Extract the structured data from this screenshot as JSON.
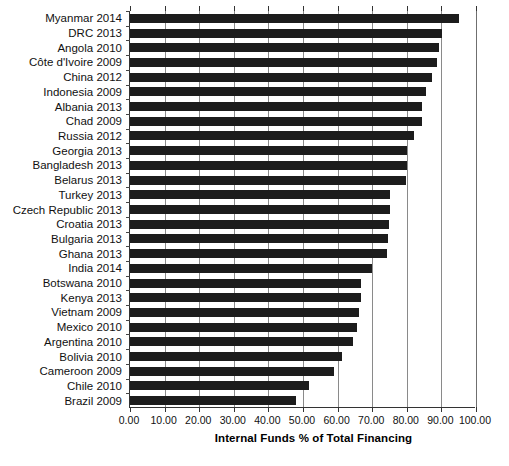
{
  "chart_data": {
    "type": "bar",
    "orientation": "horizontal",
    "title": "",
    "xlabel": "Internal Funds % of Total Financing",
    "ylabel": "",
    "xlim": [
      0,
      100
    ],
    "xticks": [
      "0.00",
      "10.00",
      "20.00",
      "30.00",
      "40.00",
      "50.00",
      "60.00",
      "70.00",
      "80.00",
      "90.00",
      "100.00"
    ],
    "xtick_values": [
      0,
      10,
      20,
      30,
      40,
      50,
      60,
      70,
      80,
      90,
      100
    ],
    "grid": true,
    "grid_axis": "x",
    "legend": "none",
    "bar_color": "#1c1c1c",
    "categories": [
      "Myanmar 2014",
      "DRC 2013",
      "Angola 2010",
      "Côte d'Ivoire 2009",
      "China 2012",
      "Indonesia 2009",
      "Albania 2013",
      "Chad 2009",
      "Russia 2012",
      "Georgia 2013",
      "Bangladesh 2013",
      "Belarus 2013",
      "Turkey 2013",
      "Czech Republic 2013",
      "Croatia 2013",
      "Bulgaria 2013",
      "Ghana 2013",
      "India 2014",
      "Botswana 2010",
      "Kenya 2013",
      "Vietnam 2009",
      "Mexico 2010",
      "Argentina 2010",
      "Bolivia 2010",
      "Cameroon 2009",
      "Chile 2010",
      "Brazil 2009"
    ],
    "values": [
      95.1,
      90.3,
      89.4,
      88.7,
      87.4,
      85.5,
      84.5,
      84.5,
      82.2,
      80.1,
      80.0,
      79.7,
      75.2,
      75.1,
      74.8,
      74.6,
      74.4,
      69.8,
      66.9,
      66.9,
      66.1,
      65.5,
      64.4,
      61.2,
      59.0,
      51.8,
      48.1
    ]
  }
}
